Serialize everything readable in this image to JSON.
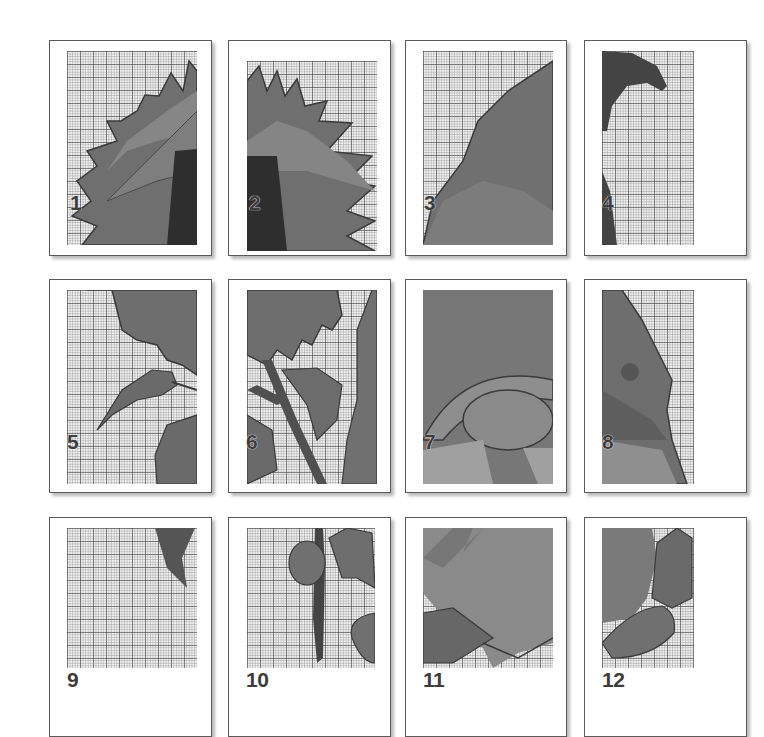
{
  "document": {
    "title": "Cross-stitch pattern page overview",
    "grid": {
      "rows": 3,
      "cols": 4
    },
    "pages": [
      {
        "number": "1",
        "content": "sunflower-left-petals-center"
      },
      {
        "number": "2",
        "content": "sunflower-right-petals-center"
      },
      {
        "number": "3",
        "content": "gnome-hat-top"
      },
      {
        "number": "4",
        "content": "gnome-hat-tip"
      },
      {
        "number": "5",
        "content": "sunflower-lower-petals-leaf"
      },
      {
        "number": "6",
        "content": "sunflower-stem-leaves"
      },
      {
        "number": "7",
        "content": "gnome-hat-brim-nose"
      },
      {
        "number": "8",
        "content": "gnome-hat-side"
      },
      {
        "number": "9",
        "content": "leaf-tip"
      },
      {
        "number": "10",
        "content": "stem-and-leaves-bottom"
      },
      {
        "number": "11",
        "content": "gnome-beard-bottom"
      },
      {
        "number": "12",
        "content": "gnome-feet"
      }
    ]
  },
  "colors": {
    "page_border": "#5a5a5a",
    "grid_bg": "#f1f1f1",
    "dark": "#3e3e3e",
    "mid": "#6e6e6e",
    "light": "#8e8e8e",
    "pale": "#b0b0b0"
  }
}
